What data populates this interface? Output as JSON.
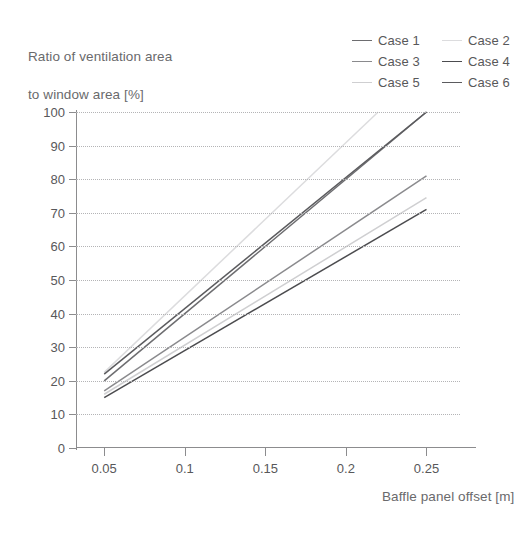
{
  "chart_data": {
    "type": "line",
    "title": "",
    "ylabel": "Ratio of ventilation area\nto window area [%]",
    "xlabel": "Baffle panel offset [m]",
    "xlim": [
      0.0325,
      0.2708
    ],
    "ylim": [
      0,
      100
    ],
    "grid": "horizontal-dotted",
    "legend_position": "top-right",
    "xticks": [
      0.05,
      0.1,
      0.15,
      0.2,
      0.25
    ],
    "xtick_labels": [
      "0.05",
      "0.1",
      "0.15",
      "0.2",
      "0.25"
    ],
    "yticks": [
      0,
      10,
      20,
      30,
      40,
      50,
      60,
      70,
      80,
      90,
      100
    ],
    "ytick_labels": [
      "0",
      "10",
      "20",
      "30",
      "40",
      "50",
      "60",
      "70",
      "80",
      "90",
      "100"
    ],
    "x": [
      0.05,
      0.25
    ],
    "series": [
      {
        "name": "Case 1",
        "color": "#6d6d70",
        "x": [
          0.05,
          0.25
        ],
        "values": [
          20.0,
          100.0
        ]
      },
      {
        "name": "Case 2",
        "color": "#dcdcde",
        "x": [
          0.05,
          0.22
        ],
        "values": [
          22.5,
          100.0
        ]
      },
      {
        "name": "Case 3",
        "color": "#8a8a8d",
        "x": [
          0.05,
          0.25
        ],
        "values": [
          17.0,
          81.0
        ]
      },
      {
        "name": "Case 4",
        "color": "#4c4c4f",
        "x": [
          0.05,
          0.25
        ],
        "values": [
          15.0,
          71.0
        ]
      },
      {
        "name": "Case 5",
        "color": "#cfcfd1",
        "x": [
          0.05,
          0.25
        ],
        "values": [
          16.0,
          74.5
        ]
      },
      {
        "name": "Case 6",
        "color": "#5b5b5e",
        "x": [
          0.05,
          0.25
        ],
        "values": [
          22.0,
          100.0
        ]
      }
    ]
  },
  "legend": {
    "entries": [
      {
        "label": "Case 1",
        "color": "#6d6d70"
      },
      {
        "label": "Case 2",
        "color": "#dcdcde"
      },
      {
        "label": "Case 3",
        "color": "#8a8a8d"
      },
      {
        "label": "Case 4",
        "color": "#4c4c4f"
      },
      {
        "label": "Case 5",
        "color": "#cfcfd1"
      },
      {
        "label": "Case 6",
        "color": "#5b5b5e"
      }
    ]
  },
  "axes": {
    "y_title_line1": "Ratio of ventilation area",
    "y_title_line2": "to window area [%]",
    "x_title": "Baffle panel offset [m]"
  },
  "colors": {
    "axis": "#8c8c8e",
    "grid": "#b4b4b6",
    "text": "#58585a",
    "background": "#ffffff"
  }
}
